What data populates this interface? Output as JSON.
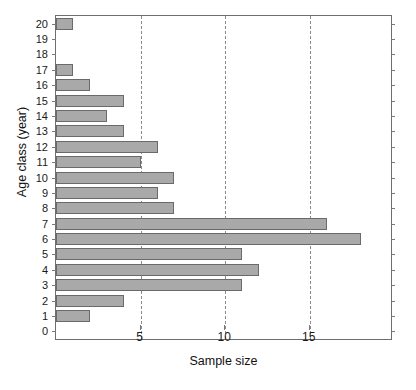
{
  "chart_data": {
    "type": "bar",
    "orientation": "horizontal",
    "title": "",
    "xlabel": "Sample size",
    "ylabel": "Age class (year)",
    "categories": [
      "0",
      "1",
      "2",
      "3",
      "4",
      "5",
      "6",
      "7",
      "8",
      "9",
      "10",
      "11",
      "12",
      "13",
      "14",
      "15",
      "16",
      "17",
      "18",
      "19",
      "20"
    ],
    "values": [
      0,
      2,
      4,
      11,
      12,
      11,
      18,
      16,
      7,
      6,
      7,
      5,
      6,
      4,
      3,
      4,
      2,
      1,
      0,
      0,
      1
    ],
    "xlim": [
      0,
      19.8
    ],
    "ylim": [
      -0.5,
      20.5
    ],
    "xticks": [
      5,
      10,
      15
    ],
    "xtick_labels": [
      "5",
      "10",
      "15"
    ],
    "ytick_labels": [
      "20",
      "19",
      "18",
      "17",
      "16",
      "15",
      "14",
      "13",
      "12",
      "11",
      "10",
      "9",
      "8",
      "7",
      "6",
      "5",
      "4",
      "3",
      "2",
      "1",
      "0"
    ],
    "grid": "vertical-dashed",
    "legend": null,
    "bar_color": "#a9a9a9",
    "bar_edge_color": "#6a6a6a",
    "grid_color": "#8a8a8a",
    "axis_color": "#6e6e6e"
  }
}
